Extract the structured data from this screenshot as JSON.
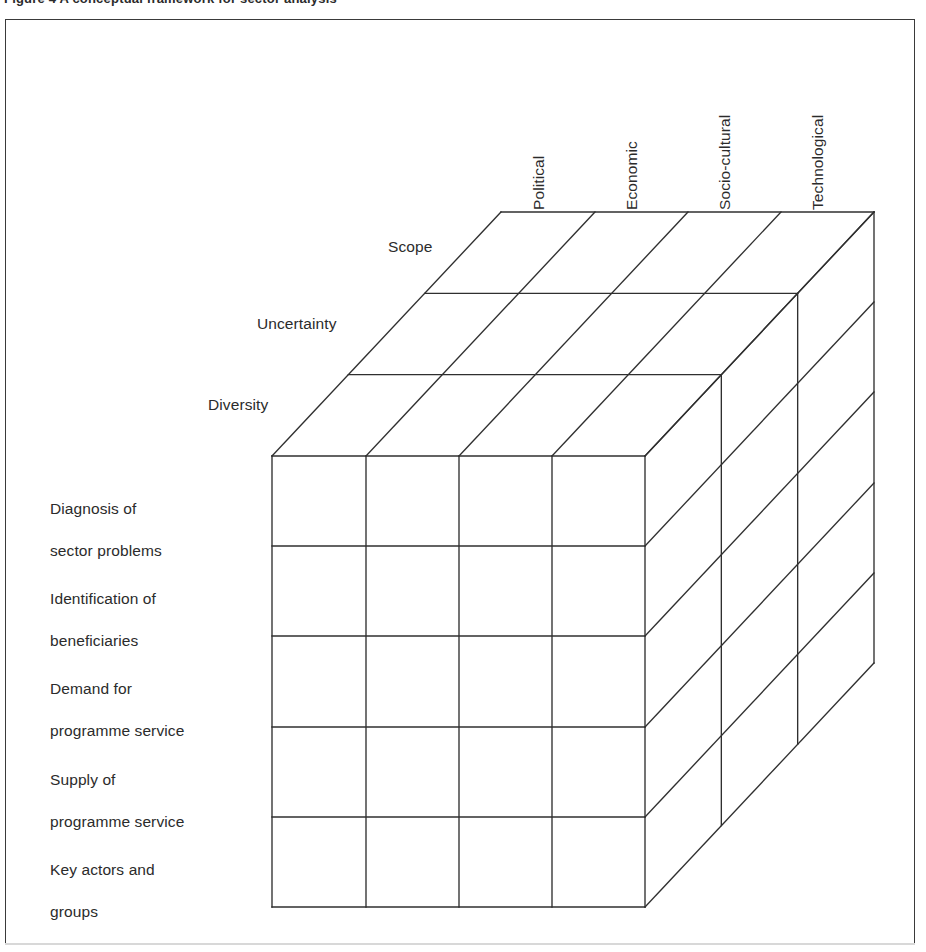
{
  "figure": {
    "caption": "Figure 4   A conceptual framework for sector analysis",
    "border_color": "#3a3a3a",
    "line_color": "#2f2f2f",
    "background": "#ffffff"
  },
  "chart_data": {
    "type": "diagram-3d-matrix",
    "title": "Figure 4   A conceptual framework for sector analysis",
    "dimensions": 3,
    "axes": {
      "columns": {
        "name": "Environment dimensions",
        "orientation": "horizontal-top-rotated",
        "count": 4,
        "labels": [
          "Political",
          "Economic",
          "Socio-cultural",
          "Technological"
        ]
      },
      "rows": {
        "name": "Analysis topics",
        "orientation": "vertical-left",
        "count": 5,
        "labels": [
          "Diagnosis of\nsector problems",
          "Identification of\nbeneficiaries",
          "Demand for\nprogramme service",
          "Supply of\nprogramme service",
          "Key actors and\ngroups"
        ]
      },
      "depth": {
        "name": "Attributes",
        "orientation": "oblique-depth",
        "count": 3,
        "labels": [
          "Scope",
          "Uncertainty",
          "Diversity"
        ],
        "order_front_to_back": [
          "Diversity",
          "Uncertainty",
          "Scope"
        ]
      }
    },
    "cells_total": 60,
    "grid_on": true,
    "legend": "none"
  },
  "geometry": {
    "front_left_x": 272,
    "front_right_x": 645,
    "front_top_y": 456,
    "front_bottom_y": 907,
    "depth_dx": 229,
    "depth_dy": -244,
    "col_x": [
      272,
      366,
      459,
      552,
      645
    ],
    "row_y": [
      456,
      546,
      636,
      727,
      817,
      907
    ]
  },
  "columns": [
    {
      "id": "col-political",
      "label": "Political",
      "label_left": 548,
      "label_bottom": 192
    },
    {
      "id": "col-economic",
      "label": "Economic",
      "label_left": 641,
      "label_bottom": 192
    },
    {
      "id": "col-socio-cultural",
      "label": "Socio-cultural",
      "label_left": 734,
      "label_bottom": 192
    },
    {
      "id": "col-technological",
      "label": "Technological",
      "label_left": 827,
      "label_bottom": 192
    }
  ],
  "rows": [
    {
      "id": "row-diagnosis",
      "line1": "Diagnosis of",
      "line2": "sector problems",
      "left": 50,
      "top": 477
    },
    {
      "id": "row-identification",
      "line1": "Identification of",
      "line2": "beneficiaries",
      "left": 50,
      "top": 567
    },
    {
      "id": "row-demand",
      "line1": "Demand for",
      "line2": "programme service",
      "left": 50,
      "top": 657
    },
    {
      "id": "row-supply",
      "line1": "Supply of",
      "line2": "programme service",
      "left": 50,
      "top": 748
    },
    {
      "id": "row-key-actors",
      "line1": "Key actors and",
      "line2": "groups",
      "left": 50,
      "top": 838
    }
  ],
  "depths": [
    {
      "id": "depth-scope",
      "label": "Scope",
      "left": 388,
      "top": 238
    },
    {
      "id": "depth-uncertainty",
      "label": "Uncertainty",
      "left": 257,
      "top": 315
    },
    {
      "id": "depth-diversity",
      "label": "Diversity",
      "left": 208,
      "top": 396
    }
  ]
}
